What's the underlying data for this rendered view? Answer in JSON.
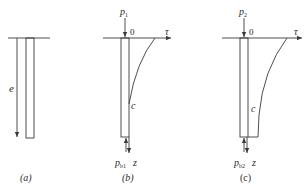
{
  "figure": {
    "panels": [
      {
        "id": "a",
        "caption": "(a)",
        "labels": {
          "depth": "e"
        }
      },
      {
        "id": "b",
        "caption": "(b)",
        "labels": {
          "top_load": "p",
          "top_load_sub": "1",
          "origin": "0",
          "x_axis": "τ",
          "curve": "c",
          "base_reaction": "p",
          "base_reaction_sub": "b1",
          "depth_axis": "z"
        }
      },
      {
        "id": "c",
        "caption": "(c)",
        "labels": {
          "top_load": "p",
          "top_load_sub": "2",
          "origin": "0",
          "x_axis": "τ",
          "curve": "c",
          "base_reaction": "p",
          "base_reaction_sub": "b2",
          "depth_axis": "z"
        }
      }
    ]
  }
}
